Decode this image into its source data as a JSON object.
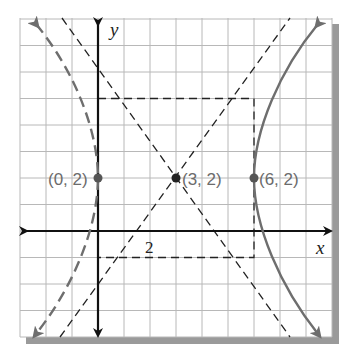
{
  "figure": {
    "type": "hyperbola-graph",
    "axes": {
      "x_label": "x",
      "y_label": "y",
      "x_range": [
        -3,
        9
      ],
      "y_range": [
        -4,
        8
      ],
      "grid": true,
      "tick_label": "2"
    },
    "center": {
      "label": "(3, 2)",
      "x": 3,
      "y": 2
    },
    "vertices": [
      {
        "label": "(0, 2)",
        "x": 0,
        "y": 2
      },
      {
        "label": "(6, 2)",
        "x": 6,
        "y": 2
      }
    ],
    "box": {
      "x_min": 0,
      "x_max": 6,
      "y_min": -1,
      "y_max": 5
    },
    "asymptotes": [
      "y - 2 = x - 3",
      "y - 2 = -(x - 3)"
    ],
    "colors": {
      "grid": "#b8b8b8",
      "axis": "#111111",
      "curve": "#6e6e6e",
      "dashed": "#222222",
      "shadow": "#9a9a9a",
      "label": "#6b6b6b"
    }
  }
}
